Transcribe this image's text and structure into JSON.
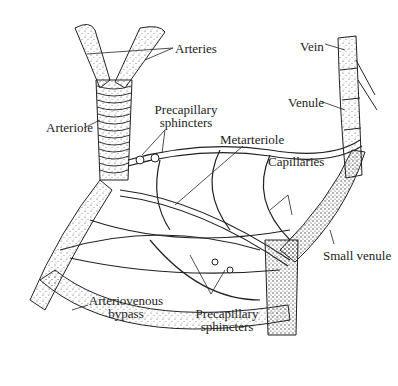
{
  "figure": {
    "labels": {
      "arteries": "Arteries",
      "arteriole": "Arteriole",
      "precapillary_sphincters_top_1": "Precapillary",
      "precapillary_sphincters_top_2": "sphincters",
      "metarteriole": "Metarteriole",
      "capillaries": "Capillaries",
      "vein": "Vein",
      "venule": "Venule",
      "small_venule": "Small venule",
      "arteriovenous_bypass_1": "Arteriovenous",
      "arteriovenous_bypass_2": "bypass",
      "precapillary_sphincters_bottom_1": "Precapillary",
      "precapillary_sphincters_bottom_2": "sphincters"
    },
    "colors": {
      "ink": "#222222",
      "stipple": "#666666",
      "background": "#ffffff"
    }
  }
}
